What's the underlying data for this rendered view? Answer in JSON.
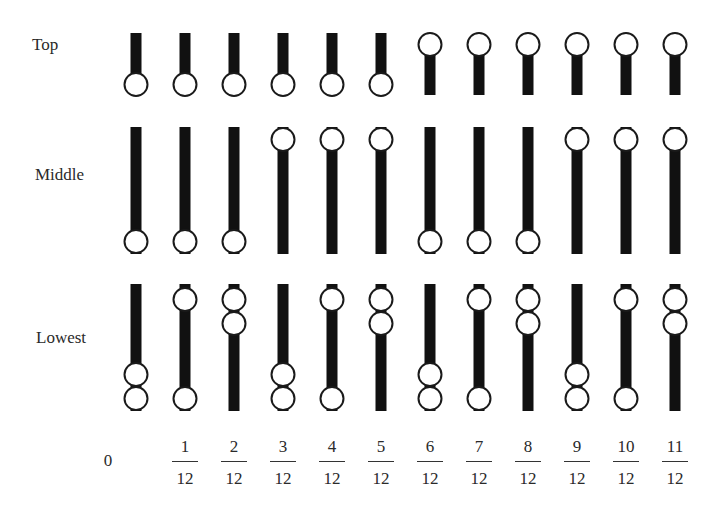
{
  "rows": [
    {
      "label": "Top",
      "key": "top"
    },
    {
      "label": "Middle",
      "key": "middle"
    },
    {
      "label": "Lowest",
      "key": "lowest"
    }
  ],
  "ticks": [
    {
      "numerator": "0",
      "denominator": ""
    },
    {
      "numerator": "1",
      "denominator": "12"
    },
    {
      "numerator": "2",
      "denominator": "12"
    },
    {
      "numerator": "3",
      "denominator": "12"
    },
    {
      "numerator": "4",
      "denominator": "12"
    },
    {
      "numerator": "5",
      "denominator": "12"
    },
    {
      "numerator": "6",
      "denominator": "12"
    },
    {
      "numerator": "7",
      "denominator": "12"
    },
    {
      "numerator": "8",
      "denominator": "12"
    },
    {
      "numerator": "9",
      "denominator": "12"
    },
    {
      "numerator": "10",
      "denominator": "12"
    },
    {
      "numerator": "11",
      "denominator": "12"
    }
  ],
  "columns": [
    {
      "top": "bottom",
      "middle": "bottom",
      "lowest": [
        "b1",
        "b2"
      ]
    },
    {
      "top": "bottom",
      "middle": "bottom",
      "lowest": [
        "t1",
        "b2"
      ]
    },
    {
      "top": "bottom",
      "middle": "bottom",
      "lowest": [
        "t1",
        "t2"
      ]
    },
    {
      "top": "bottom",
      "middle": "top",
      "lowest": [
        "b1",
        "b2"
      ]
    },
    {
      "top": "bottom",
      "middle": "top",
      "lowest": [
        "t1",
        "b2"
      ]
    },
    {
      "top": "bottom",
      "middle": "top",
      "lowest": [
        "t1",
        "t2"
      ]
    },
    {
      "top": "top",
      "middle": "bottom",
      "lowest": [
        "b1",
        "b2"
      ]
    },
    {
      "top": "top",
      "middle": "bottom",
      "lowest": [
        "t1",
        "b2"
      ]
    },
    {
      "top": "top",
      "middle": "bottom",
      "lowest": [
        "t1",
        "t2"
      ]
    },
    {
      "top": "top",
      "middle": "top",
      "lowest": [
        "b1",
        "b2"
      ]
    },
    {
      "top": "top",
      "middle": "top",
      "lowest": [
        "t1",
        "b2"
      ]
    },
    {
      "top": "top",
      "middle": "top",
      "lowest": [
        "t1",
        "t2"
      ]
    }
  ],
  "colors": {
    "bar": "#111111",
    "bead_stroke": "#1a1a1a",
    "bead_fill": "#ffffff"
  }
}
